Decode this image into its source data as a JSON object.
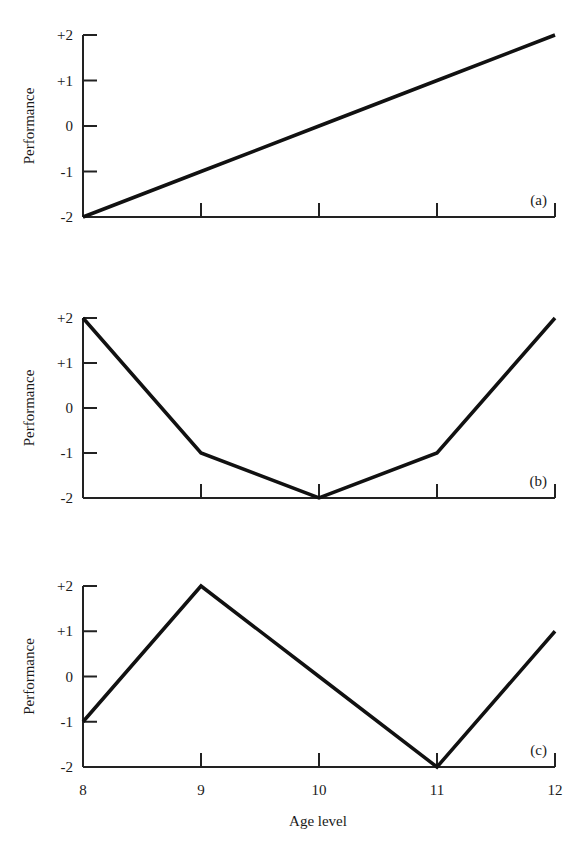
{
  "figure": {
    "panels": [
      {
        "label": "(a)",
        "ylabel": "Performance"
      },
      {
        "label": "(b)",
        "ylabel": "Performance"
      },
      {
        "label": "(c)",
        "ylabel": "Performance"
      }
    ],
    "ytick_labels": [
      "+2",
      "+1",
      "0",
      "-1",
      "-2"
    ],
    "xtick_labels": [
      "8",
      "9",
      "10",
      "11",
      "12"
    ],
    "xlabel": "Age level",
    "line_color": "#111111"
  },
  "chart_data": [
    {
      "type": "line",
      "title": "(a)",
      "xlabel": "",
      "ylabel": "Performance",
      "x": [
        8,
        9,
        10,
        11,
        12
      ],
      "series": [
        {
          "name": "(a)",
          "values": [
            -2,
            -1,
            0,
            1,
            2
          ]
        }
      ],
      "xlim": [
        8,
        12
      ],
      "ylim": [
        -2,
        2
      ],
      "yticks": [
        "+2",
        "+1",
        "0",
        "-1",
        "-2"
      ],
      "grid": false
    },
    {
      "type": "line",
      "title": "(b)",
      "xlabel": "",
      "ylabel": "Performance",
      "x": [
        8,
        9,
        10,
        11,
        12
      ],
      "series": [
        {
          "name": "(b)",
          "values": [
            2,
            -1,
            -2,
            -1,
            2
          ]
        }
      ],
      "xlim": [
        8,
        12
      ],
      "ylim": [
        -2,
        2
      ],
      "yticks": [
        "+2",
        "+1",
        "0",
        "-1",
        "-2"
      ],
      "grid": false
    },
    {
      "type": "line",
      "title": "(c)",
      "xlabel": "Age level",
      "ylabel": "Performance",
      "x": [
        8,
        9,
        10,
        11,
        12
      ],
      "series": [
        {
          "name": "(c)",
          "values": [
            -1,
            2,
            0,
            -2,
            1
          ]
        }
      ],
      "xlim": [
        8,
        12
      ],
      "ylim": [
        -2,
        2
      ],
      "xticks": [
        "8",
        "9",
        "10",
        "11",
        "12"
      ],
      "yticks": [
        "+2",
        "+1",
        "0",
        "-1",
        "-2"
      ],
      "grid": false
    }
  ]
}
